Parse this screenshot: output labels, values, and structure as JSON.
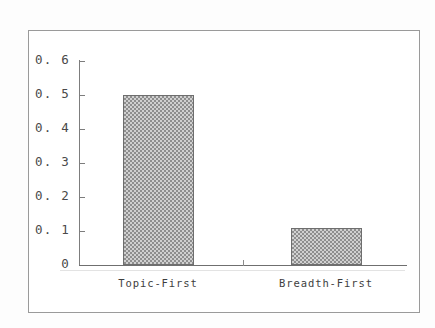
{
  "chart_data": {
    "type": "bar",
    "title": "",
    "subtitle": "",
    "xlabel": "",
    "ylabel": "",
    "categories": [
      "Topic-First",
      "Breadth-First"
    ],
    "values": [
      0.5,
      0.11
    ],
    "series": [
      {
        "name": "",
        "values": [
          0.5,
          0.11
        ]
      }
    ],
    "ylim": [
      0,
      0.6
    ],
    "yticks": [
      0,
      0.1,
      0.2,
      0.3,
      0.4,
      0.5,
      0.6
    ],
    "ytick_labels": [
      "0",
      "0. 1",
      "0. 2",
      "0. 3",
      "0. 4",
      "0. 5",
      "0. 6"
    ],
    "grid": false,
    "legend": null,
    "annotations": [],
    "bar_fill": "#c8c8c8",
    "bar_edge": "#6e6e6e",
    "axis_color": "#7d7d7d",
    "frame_color": "#9a9a9a",
    "background": "#ffffff"
  },
  "figure": {
    "frame_label": "chart-border",
    "plot_background": "#ffffff"
  }
}
